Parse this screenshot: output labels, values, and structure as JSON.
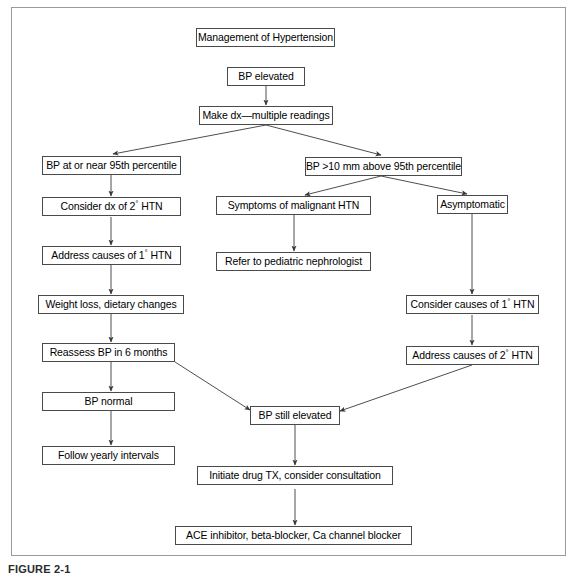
{
  "figure": {
    "caption": "FIGURE 2-1",
    "frame": {
      "border_color": "#9a9a9a"
    },
    "box_border_color": "#4a4a4a",
    "line_color": "#3a3a3a",
    "background": "#ffffff"
  },
  "nodes": {
    "title": "Management of Hypertension",
    "bp_elevated": "BP elevated",
    "make_dx": "Make dx—multiple readings",
    "bp_at_near_95": "BP at or near 95th percentile",
    "bp_above_95": "BP >10 mm above 95th percentile",
    "consider_dx_2_htn": "Consider dx of 2° HTN",
    "symptoms_malignant": "Symptoms of malignant HTN",
    "asymptomatic": "Asymptomatic",
    "address_causes_1_htn": "Address causes of 1° HTN",
    "refer_nephrologist": "Refer to pediatric nephrologist",
    "weight_loss": "Weight loss, dietary changes",
    "consider_causes_1_htn": "Consider causes of 1° HTN",
    "reassess_bp": "Reassess BP in 6 months",
    "address_causes_2_htn": "Address causes of 2° HTN",
    "bp_normal": "BP normal",
    "bp_still_elevated": "BP still elevated",
    "follow_yearly": "Follow yearly intervals",
    "initiate_drug": "Initiate drug TX, consider consultation",
    "ace_inhibitor": "ACE inhibitor, beta-blocker, Ca channel blocker"
  }
}
